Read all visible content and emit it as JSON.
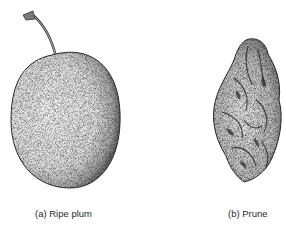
{
  "figure": {
    "panels": [
      {
        "label": "(a) Ripe plum",
        "subject": "plum-illustration"
      },
      {
        "label": "(b) Prune",
        "subject": "prune-illustration"
      }
    ]
  }
}
